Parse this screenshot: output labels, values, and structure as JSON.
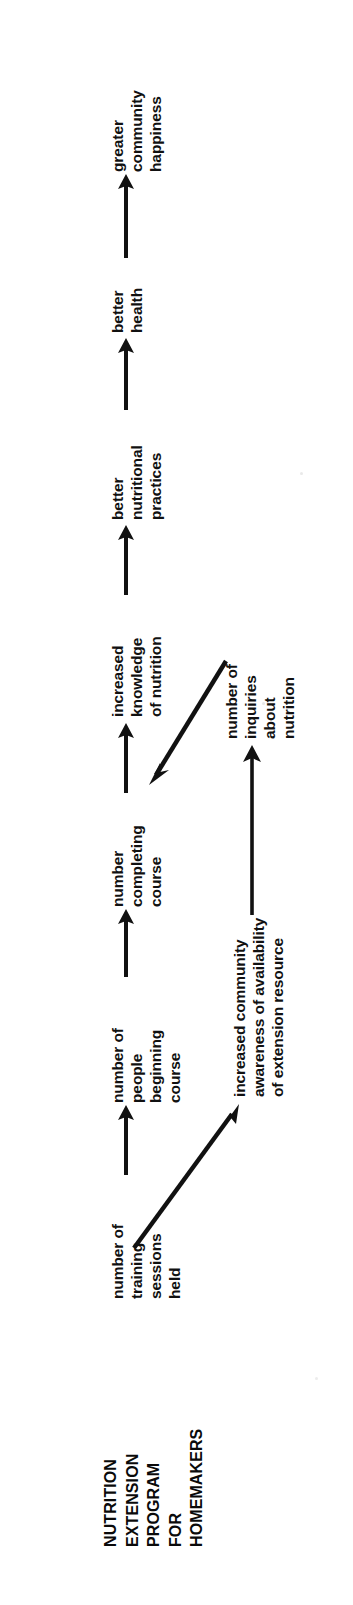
{
  "document": {
    "type": "program-logic-model-diagram",
    "orientation": "rotated-90-counterclockwise",
    "background_color": "#ffffff",
    "ink_color": "#111111"
  },
  "title": {
    "name": "program-title",
    "lines": [
      "NUTRITION",
      "EXTENSION",
      "PROGRAM",
      "FOR",
      "HOMEMAKERS"
    ]
  },
  "nodes": [
    {
      "id": "training-sessions",
      "lines": [
        "number of",
        "training",
        "sessions",
        "held"
      ]
    },
    {
      "id": "people-beginning",
      "lines": [
        "number of",
        "people",
        "beginning",
        "course"
      ]
    },
    {
      "id": "number-completing",
      "lines": [
        "number",
        "completing",
        "course"
      ]
    },
    {
      "id": "increased-knowledge",
      "lines": [
        "increased",
        "knowledge",
        "of nutrition"
      ]
    },
    {
      "id": "better-practices",
      "lines": [
        "better",
        "nutritional",
        "practices"
      ]
    },
    {
      "id": "better-health",
      "lines": [
        "better",
        "health"
      ]
    },
    {
      "id": "greater-happiness",
      "lines": [
        "greater",
        "community",
        "happiness"
      ]
    },
    {
      "id": "community-awareness",
      "lines": [
        "increased community",
        "awareness of availability",
        "of extension resource"
      ]
    },
    {
      "id": "number-inquiries",
      "lines": [
        "number of",
        "inquiries",
        "about",
        "nutrition"
      ]
    }
  ],
  "connections": [
    {
      "id": "arrow-sessions-to-people",
      "from": "training-sessions",
      "to": "people-beginning",
      "style": "straight"
    },
    {
      "id": "arrow-people-to-completing",
      "from": "people-beginning",
      "to": "number-completing",
      "style": "straight"
    },
    {
      "id": "arrow-completing-to-knowledge",
      "from": "number-completing",
      "to": "increased-knowledge",
      "style": "straight"
    },
    {
      "id": "arrow-knowledge-to-practices",
      "from": "increased-knowledge",
      "to": "better-practices",
      "style": "straight"
    },
    {
      "id": "arrow-practices-to-health",
      "from": "better-practices",
      "to": "better-health",
      "style": "straight"
    },
    {
      "id": "arrow-health-to-happiness",
      "from": "better-health",
      "to": "greater-happiness",
      "style": "straight"
    },
    {
      "id": "arrow-sessions-to-awareness",
      "from": "training-sessions",
      "to": "community-awareness",
      "style": "diagonal"
    },
    {
      "id": "arrow-awareness-to-inquiries",
      "from": "community-awareness",
      "to": "number-inquiries",
      "style": "straight"
    },
    {
      "id": "arrow-inquiries-to-knowledge",
      "from": "number-inquiries",
      "to": "increased-knowledge",
      "style": "diagonal"
    }
  ]
}
